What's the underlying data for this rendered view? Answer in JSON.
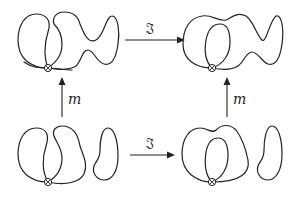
{
  "diagram": {
    "type": "commutative-square",
    "nodes": {
      "top_left": {
        "description": "two-lobed closed curve with overlapping inner loop and right lobe, crossing marker at bottom"
      },
      "top_right": {
        "description": "closed curve with inner loop and extended right lobe, crossing marker at bottom"
      },
      "bottom_left": {
        "description": "two loops with crossing marker at bottom plus separate small right loop"
      },
      "bottom_right": {
        "description": "outer loop with inner loop, crossing marker at bottom, plus separate small right loop"
      }
    },
    "arrows": {
      "top": {
        "label": "𝔍",
        "from": "top_left",
        "to": "top_right"
      },
      "bottom": {
        "label": "𝔍",
        "from": "bottom_left",
        "to": "bottom_right"
      },
      "left": {
        "label": "m",
        "from": "bottom_left",
        "to": "top_left"
      },
      "right": {
        "label": "m",
        "from": "bottom_right",
        "to": "top_right"
      }
    },
    "colors": {
      "stroke": "#222222",
      "background": "#ffffff"
    }
  }
}
